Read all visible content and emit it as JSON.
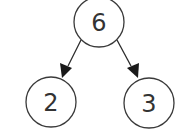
{
  "diagram": {
    "type": "tree",
    "nodes": [
      {
        "id": "root",
        "label": "6",
        "cx": 99,
        "cy": 22,
        "r": 25
      },
      {
        "id": "left",
        "label": "2",
        "cx": 51,
        "cy": 102,
        "r": 25
      },
      {
        "id": "right",
        "label": "3",
        "cx": 149,
        "cy": 103,
        "r": 25
      }
    ],
    "edges": [
      {
        "from": "root",
        "to": "left"
      },
      {
        "from": "root",
        "to": "right"
      }
    ]
  }
}
